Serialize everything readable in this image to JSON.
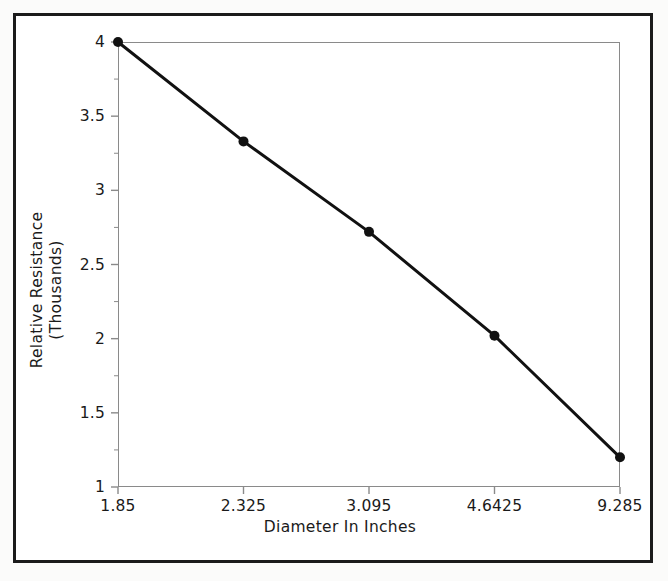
{
  "chart_data": {
    "type": "line",
    "title": "",
    "subtitle": "",
    "xlabel": "Diameter In Inches",
    "ylabel_line1": "Relative Resistance",
    "ylabel_line2": "(Thousands)",
    "ylabel": "Relative Resistance (Thousands)",
    "categories": [
      "1.85",
      "2.325",
      "3.095",
      "4.6425",
      "9.285"
    ],
    "x": [
      1.85,
      2.325,
      3.095,
      4.6425,
      9.285
    ],
    "values": [
      4.0,
      3.33,
      2.72,
      2.02,
      1.2
    ],
    "series": [
      {
        "name": "Relative Resistance",
        "values": [
          4.0,
          3.33,
          2.72,
          2.02,
          1.2
        ]
      }
    ],
    "ylim": [
      1,
      4
    ],
    "yticks": [
      "1",
      "1.5",
      "2",
      "2.5",
      "3",
      "3.5",
      "4"
    ],
    "ytick_values": [
      1,
      1.5,
      2,
      2.5,
      3,
      3.5,
      4
    ],
    "xticks": [
      "1.85",
      "2.325",
      "3.095",
      "4.6425",
      "9.285"
    ],
    "grid": false,
    "legend": false,
    "legend_position": "none",
    "axis_scale_note": "x axis is categorical / evenly spaced",
    "colors": {
      "line": "#111111",
      "marker": "#111111",
      "plot_frame": "#8a8a8a",
      "outer_frame": "#1b1b1b",
      "background": "#ffffff",
      "text": "#1a1a1a"
    },
    "style": {
      "line_width": 3,
      "marker": "circle",
      "marker_size": 9
    }
  }
}
